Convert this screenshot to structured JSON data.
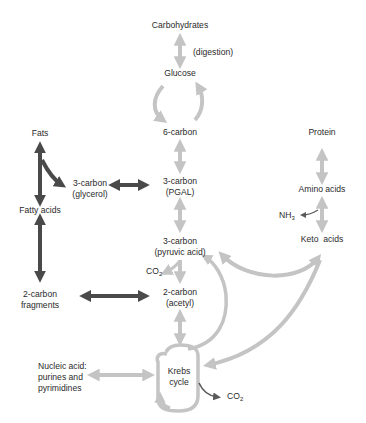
{
  "colors": {
    "light_arrow": "#c4c4c4",
    "dark_arrow": "#4a4a4a",
    "text": "#2a2a2a",
    "background": "#ffffff"
  },
  "nodes": {
    "carbohydrates": "Carbohydrates",
    "digestion": "(digestion)",
    "glucose": "Glucose",
    "six_carbon": "6-carbon",
    "fats": "Fats",
    "glycerol_line1": "3-carbon",
    "glycerol_line2": "(glycerol)",
    "pgal_line1": "3-carbon",
    "pgal_line2": "(PGAL)",
    "fatty_acids": "Fatty acids",
    "pyruvic_line1": "3-carbon",
    "pyruvic_line2": "(pyruvic acid)",
    "co2_a": "CO",
    "co2_a_sub": "2",
    "two_carbon_frag_line1": "2-carbon",
    "two_carbon_frag_line2": "fragments",
    "acetyl_line1": "2-carbon",
    "acetyl_line2": "(acetyl)",
    "protein": "Protein",
    "amino_acids": "Amino acids",
    "nh3": "NH",
    "nh3_sub": "3",
    "keto_acids": "Keto  acids",
    "nucleic_line1": "Nucleic acid:",
    "nucleic_line2": "purines and",
    "nucleic_line3": "pyrimidines",
    "krebs_line1": "Krebs",
    "krebs_line2": "cycle",
    "co2_b": "CO",
    "co2_b_sub": "2"
  },
  "edges": [
    {
      "from": "Carbohydrates",
      "to": "Glucose",
      "type": "bidirectional",
      "style": "light",
      "label": "(digestion)"
    },
    {
      "from": "Glucose",
      "to": "6-carbon",
      "type": "cycle",
      "style": "light"
    },
    {
      "from": "6-carbon",
      "to": "3-carbon (PGAL)",
      "type": "bidirectional",
      "style": "light"
    },
    {
      "from": "Fats",
      "to": "Fatty acids",
      "type": "bidirectional",
      "style": "dark"
    },
    {
      "from": "Fats",
      "to": "3-carbon (glycerol)",
      "type": "directional",
      "style": "dark"
    },
    {
      "from": "3-carbon (glycerol)",
      "to": "3-carbon (PGAL)",
      "type": "bidirectional",
      "style": "dark"
    },
    {
      "from": "Fatty acids",
      "to": "2-carbon fragments",
      "type": "bidirectional",
      "style": "dark"
    },
    {
      "from": "2-carbon fragments",
      "to": "2-carbon (acetyl)",
      "type": "bidirectional",
      "style": "dark"
    },
    {
      "from": "3-carbon (PGAL)",
      "to": "3-carbon (pyruvic acid)",
      "type": "bidirectional",
      "style": "light"
    },
    {
      "from": "3-carbon (pyruvic acid)",
      "to": "2-carbon (acetyl)",
      "type": "directional",
      "style": "light",
      "byproduct": "CO2"
    },
    {
      "from": "2-carbon (acetyl)",
      "to": "Krebs cycle",
      "type": "bidirectional",
      "style": "light"
    },
    {
      "from": "Krebs cycle",
      "to": "3-carbon (pyruvic acid)",
      "type": "directional",
      "style": "light"
    },
    {
      "from": "3-carbon (pyruvic acid)",
      "to": "Keto acids",
      "type": "bidirectional",
      "style": "light"
    },
    {
      "from": "Keto acids",
      "to": "Krebs cycle",
      "type": "directional",
      "style": "light"
    },
    {
      "from": "Protein",
      "to": "Amino acids",
      "type": "bidirectional",
      "style": "light"
    },
    {
      "from": "Amino acids",
      "to": "Keto acids",
      "type": "bidirectional",
      "style": "light",
      "byproduct": "NH3"
    },
    {
      "from": "Nucleic acid: purines and pyrimidines",
      "to": "Krebs cycle",
      "type": "bidirectional",
      "style": "light"
    },
    {
      "from": "Krebs cycle",
      "to": "CO2",
      "type": "directional",
      "style": "dark-thin"
    }
  ]
}
